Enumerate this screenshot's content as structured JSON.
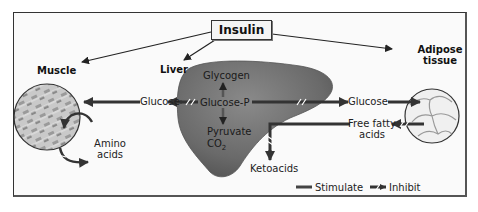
{
  "title": "Insulin",
  "tissues": {
    "muscle": "Muscle",
    "liver": "Liver",
    "adipose_line1": "Adipose",
    "adipose_line2": "tissue"
  },
  "liver_labels": {
    "glycogen": "Glycogen",
    "glucose_p": "Glucose-P",
    "pyruvate": "Pyruvate",
    "co2": "CO",
    "co2_sub": "2"
  },
  "pathway_labels": {
    "glucose_left": "Glucose",
    "glucose_right": "Glucose",
    "amino_line1": "Amino",
    "amino_line2": "acids",
    "ffa_line1": "Free fatty",
    "ffa_line2": "acids",
    "ketoacids": "Ketoacids"
  },
  "legend": {
    "stimulate": "Stimulate",
    "inhibit": "Inhibit"
  },
  "colors": {
    "arrow": "#2e2e2e",
    "liver": "#6f6f6f",
    "frame": "#333333"
  }
}
